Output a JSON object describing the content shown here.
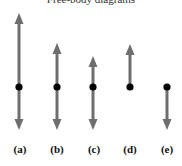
{
  "title": "Free-body diagrams",
  "colors": {
    "arrow": "#6e6e6e",
    "dot": "#000000",
    "background": "#ffffff"
  },
  "diagrams": [
    {
      "label": "(a)",
      "x": 19,
      "up_tip_y": 13,
      "dot_y": 87,
      "down_tip_y": 130,
      "has_up": true,
      "has_down": true
    },
    {
      "label": "(b)",
      "x": 57,
      "up_tip_y": 43,
      "dot_y": 87,
      "down_tip_y": 130,
      "has_up": true,
      "has_down": true
    },
    {
      "label": "(c)",
      "x": 93,
      "up_tip_y": 56,
      "dot_y": 87,
      "down_tip_y": 130,
      "has_up": true,
      "has_down": true
    },
    {
      "label": "(d)",
      "x": 130,
      "up_tip_y": 44,
      "dot_y": 87,
      "down_tip_y": null,
      "has_up": true,
      "has_down": false
    },
    {
      "label": "(e)",
      "x": 167,
      "up_tip_y": null,
      "dot_y": 87,
      "down_tip_y": 130,
      "has_up": false,
      "has_down": true
    }
  ]
}
